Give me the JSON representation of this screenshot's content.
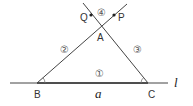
{
  "diagram": {
    "points": {
      "A": {
        "label": "A",
        "x": 100,
        "y": 27
      },
      "B": {
        "label": "B",
        "x": 37,
        "y": 83
      },
      "C": {
        "label": "C",
        "x": 148,
        "y": 83
      },
      "P": {
        "label": "P",
        "x": 114,
        "y": 15
      },
      "Q": {
        "label": "Q",
        "x": 91,
        "y": 15
      }
    },
    "regions": {
      "r1": "①",
      "r2": "②",
      "r3": "③",
      "r4": "④"
    },
    "line_label": "l",
    "side_label": "a",
    "colors": {
      "stroke": "#444444",
      "text": "#333333"
    }
  }
}
